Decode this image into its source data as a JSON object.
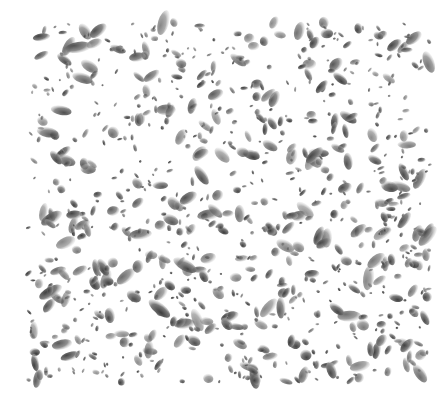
{
  "image": {
    "description": "Grayscale speckle / droplet texture of scattered dark blobs on white background",
    "background": "#ffffff",
    "region": {
      "x": 28,
      "y": 22,
      "width": 402,
      "height": 360
    },
    "blob": {
      "count": 900,
      "seed": 1337,
      "min_r": 1.2,
      "max_r": 5.5,
      "elongation_max": 2.4,
      "dark": "#3c3c3c",
      "mid": "#7a7a7a",
      "light": "#cfcfcf"
    }
  }
}
